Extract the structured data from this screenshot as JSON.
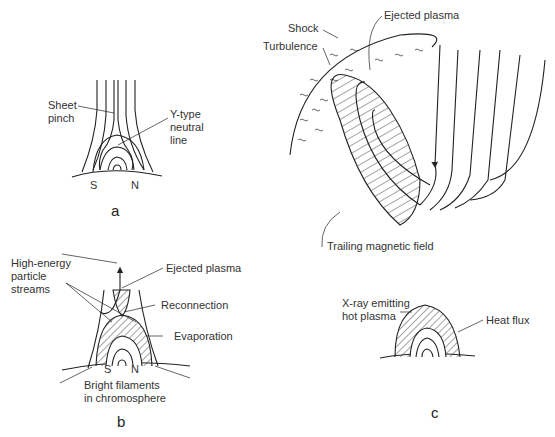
{
  "figure": {
    "panels": [
      {
        "id": "a",
        "caption": "a",
        "labels": {
          "sheet_pinch": "Sheet\npinch",
          "y_type_neutral_line": "Y-type\nneutral\nline",
          "pole_s": "S",
          "pole_n": "N"
        }
      },
      {
        "id": "b",
        "caption": "b",
        "labels": {
          "high_energy_particle_streams": "High-energy\nparticle\nstreams",
          "ejected_plasma": "Ejected plasma",
          "reconnection": "Reconnection",
          "evaporation": "Evaporation",
          "pole_s": "S",
          "pole_n": "N",
          "bright_filaments": "Bright filaments\nin chromosphere"
        }
      },
      {
        "id": "c",
        "caption": "c",
        "labels": {
          "shock": "Shock",
          "turbulence": "Turbulence",
          "ejected_plasma": "Ejected plasma",
          "trailing_magnetic_field": "Trailing magnetic field",
          "xray_hot_plasma": "X-ray emitting\nhot plasma",
          "heat_flux": "Heat flux"
        }
      }
    ]
  }
}
